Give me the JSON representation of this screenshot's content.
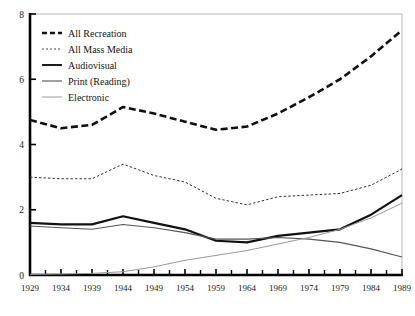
{
  "chart_data": {
    "type": "line",
    "title": "",
    "xlabel": "",
    "ylabel": "",
    "xlim": [
      1929,
      1989
    ],
    "ylim": [
      0,
      8
    ],
    "grid": false,
    "legend_position": "top-left",
    "x": [
      1929,
      1934,
      1939,
      1944,
      1949,
      1954,
      1959,
      1964,
      1969,
      1974,
      1979,
      1984,
      1989
    ],
    "xtick_labels": [
      "1929",
      "1934",
      "1939",
      "1944",
      "1949",
      "1954",
      "1959",
      "1964",
      "1969",
      "1974",
      "1979",
      "1984",
      "1989"
    ],
    "ytick_labels": [
      "0",
      "2",
      "4",
      "6",
      "8"
    ],
    "ytick_values": [
      0,
      2,
      4,
      6,
      8
    ],
    "series": [
      {
        "name": "All Recreation",
        "style": "dashed-bold",
        "color": "#111111",
        "values": [
          4.75,
          4.5,
          4.6,
          5.15,
          4.95,
          4.7,
          4.45,
          4.55,
          4.95,
          5.45,
          6.0,
          6.7,
          7.5
        ]
      },
      {
        "name": "All Mass Media",
        "style": "dotted",
        "color": "#333333",
        "values": [
          3.0,
          2.95,
          2.95,
          3.4,
          3.05,
          2.85,
          2.35,
          2.15,
          2.4,
          2.45,
          2.5,
          2.75,
          3.25
        ]
      },
      {
        "name": "Audiovisual",
        "style": "solid-bold",
        "color": "#111111",
        "values": [
          1.6,
          1.55,
          1.55,
          1.8,
          1.6,
          1.4,
          1.05,
          1.0,
          1.2,
          1.3,
          1.4,
          1.85,
          2.45
        ]
      },
      {
        "name": "Print (Reading)",
        "style": "solid-thin",
        "color": "#555555",
        "values": [
          1.5,
          1.45,
          1.4,
          1.55,
          1.45,
          1.3,
          1.1,
          1.1,
          1.15,
          1.1,
          1.0,
          0.8,
          0.55
        ]
      },
      {
        "name": "Electronic",
        "style": "solid-light",
        "color": "#999999",
        "values": [
          0.02,
          0.03,
          0.05,
          0.1,
          0.25,
          0.45,
          0.6,
          0.75,
          0.95,
          1.15,
          1.4,
          1.75,
          2.2
        ]
      }
    ]
  },
  "legend": {
    "items": [
      {
        "label": "All Recreation",
        "style": "dashed-bold"
      },
      {
        "label": "All Mass Media",
        "style": "dotted"
      },
      {
        "label": "Audiovisual",
        "style": "solid-bold"
      },
      {
        "label": "Print (Reading)",
        "style": "solid-thin"
      },
      {
        "label": "Electronic",
        "style": "solid-light"
      }
    ]
  },
  "colors": {
    "axis": "#000000",
    "background": "#ffffff",
    "text": "#141414"
  }
}
